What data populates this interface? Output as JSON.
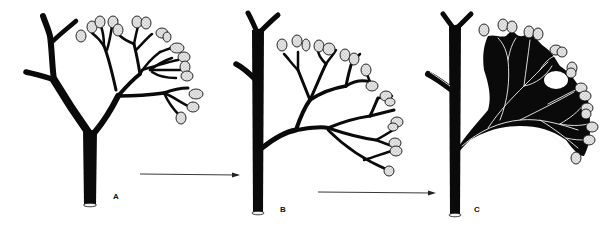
{
  "figure": {
    "panels": [
      {
        "id": "A",
        "label": "A",
        "description": "Open branching system with terminal dotted buds on slender branches from a forked trunk"
      },
      {
        "id": "B",
        "label": "B",
        "description": "Branching system arising laterally from an upright forked trunk, branches forming closed loops"
      },
      {
        "id": "C",
        "label": "C",
        "description": "Webbed branching system with black tissue filling spaces between branches; light veins remain"
      }
    ],
    "arrows": [
      {
        "from": "A",
        "to": "B"
      },
      {
        "from": "B",
        "to": "C"
      }
    ],
    "colors": {
      "ink": "#0a0a0a",
      "bud_fill": "#e4e4e4",
      "background": "#ffffff"
    }
  }
}
